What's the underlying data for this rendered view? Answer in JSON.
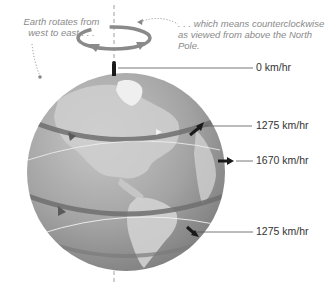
{
  "captions": {
    "left": "Earth rotates from west to east . . .",
    "right": ". . . which means counterclockwise as viewed from above the North Pole."
  },
  "speeds": [
    {
      "label": "0 km/hr",
      "position": "north-pole"
    },
    {
      "label": "1275 km/hr",
      "position": "northern-mid-latitude"
    },
    {
      "label": "1670 km/hr",
      "position": "equator"
    },
    {
      "label": "1275 km/hr",
      "position": "southern-mid-latitude"
    }
  ],
  "colors": {
    "globe_ocean": "#9a9a9a",
    "globe_land": "#c8c8c8",
    "latitude_band": "#6e6e6e",
    "rotation_arrow": "#8a8a8a",
    "arrow": "#1a1a1a",
    "label_text": "#333333",
    "caption_text": "#8a8a8a"
  }
}
